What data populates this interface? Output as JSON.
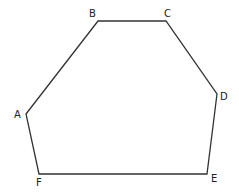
{
  "diagram": {
    "type": "hexagon",
    "stroke_color": "#333333",
    "vertices": [
      {
        "label": "A",
        "x": 26,
        "y": 114,
        "lx": 14,
        "ly": 118
      },
      {
        "label": "B",
        "x": 98,
        "y": 21,
        "lx": 89,
        "ly": 17
      },
      {
        "label": "C",
        "x": 166,
        "y": 21,
        "lx": 164,
        "ly": 17
      },
      {
        "label": "D",
        "x": 217,
        "y": 94,
        "lx": 220,
        "ly": 100
      },
      {
        "label": "E",
        "x": 207,
        "y": 174,
        "lx": 211,
        "ly": 182
      },
      {
        "label": "F",
        "x": 39,
        "y": 174,
        "lx": 36,
        "ly": 186
      }
    ]
  }
}
